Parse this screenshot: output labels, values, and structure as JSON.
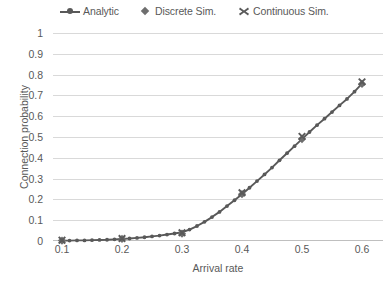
{
  "chart_data": {
    "type": "line",
    "title": "",
    "xlabel": "Arrival rate",
    "ylabel": "Connection probability",
    "xlim": [
      0.1,
      0.6
    ],
    "ylim": [
      0,
      1
    ],
    "xticks": [
      "0.1",
      "0.2",
      "0.3",
      "0.4",
      "0.5",
      "0.6"
    ],
    "yticks": [
      "0",
      "0.1",
      "0.2",
      "0.3",
      "0.4",
      "0.5",
      "0.6",
      "0.7",
      "0.8",
      "0.9",
      "1"
    ],
    "grid": true,
    "legend_position": "top",
    "series": [
      {
        "name": "Analytic",
        "marker": "line-dot",
        "color": "#595959",
        "x": [
          0.1,
          0.1125,
          0.125,
          0.1375,
          0.15,
          0.1625,
          0.175,
          0.1875,
          0.2,
          0.2125,
          0.225,
          0.2375,
          0.25,
          0.2625,
          0.275,
          0.2875,
          0.3,
          0.3125,
          0.325,
          0.3375,
          0.35,
          0.3625,
          0.375,
          0.3875,
          0.4,
          0.4125,
          0.425,
          0.4375,
          0.45,
          0.4625,
          0.475,
          0.4875,
          0.5,
          0.5125,
          0.525,
          0.5375,
          0.55,
          0.5625,
          0.575,
          0.5875,
          0.6
        ],
        "y": [
          0.002,
          0.002,
          0.003,
          0.003,
          0.004,
          0.005,
          0.006,
          0.008,
          0.01,
          0.012,
          0.015,
          0.018,
          0.022,
          0.026,
          0.031,
          0.036,
          0.042,
          0.055,
          0.072,
          0.092,
          0.115,
          0.14,
          0.168,
          0.196,
          0.225,
          0.256,
          0.288,
          0.32,
          0.353,
          0.388,
          0.422,
          0.456,
          0.49,
          0.524,
          0.557,
          0.588,
          0.62,
          0.652,
          0.683,
          0.718,
          0.757
        ]
      },
      {
        "name": "Discrete Sim.",
        "marker": "diamond",
        "color": "#6e6e6e",
        "x": [
          0.1,
          0.2,
          0.3,
          0.4,
          0.5,
          0.6
        ],
        "y": [
          0.002,
          0.01,
          0.035,
          0.225,
          0.49,
          0.755
        ]
      },
      {
        "name": "Continuous Sim.",
        "marker": "cross",
        "color": "#5a5a5a",
        "x": [
          0.1,
          0.2,
          0.3,
          0.4,
          0.5,
          0.6
        ],
        "y": [
          0.004,
          0.012,
          0.04,
          0.232,
          0.503,
          0.765
        ]
      }
    ]
  },
  "legend": {
    "entries": [
      {
        "label": "Analytic",
        "icon": "line-with-dot-marker"
      },
      {
        "label": "Discrete Sim.",
        "icon": "diamond-marker"
      },
      {
        "label": "Continuous Sim.",
        "icon": "cross-marker"
      }
    ]
  },
  "axes": {
    "x_title": "Arrival rate",
    "y_title": "Connection probability"
  },
  "colors": {
    "line": "#595959",
    "grid": "#d9d9d9",
    "text": "#595959",
    "background": "#ffffff"
  }
}
